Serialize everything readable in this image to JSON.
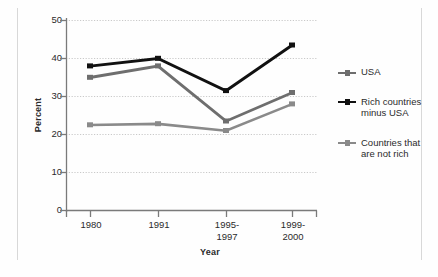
{
  "chart_data": {
    "type": "line",
    "title": "",
    "xlabel": "Year",
    "ylabel": "Percent",
    "categories": [
      "1980",
      "1991",
      "1995-\n1997",
      "1999-\n2000"
    ],
    "category_lines": [
      [
        "1980"
      ],
      [
        "1991"
      ],
      [
        "1995-",
        "1997"
      ],
      [
        "1999-",
        "2000"
      ]
    ],
    "ylim": [
      0,
      50
    ],
    "yticks": [
      0,
      10,
      20,
      30,
      40,
      50
    ],
    "grid": true,
    "legend_position": "right",
    "series": [
      {
        "name": "USA",
        "color": "#6e6e6e",
        "values": [
          35,
          38,
          23.5,
          31
        ]
      },
      {
        "name": "Rich countries minus USA",
        "color": "#111111",
        "values": [
          38,
          40,
          31.5,
          43.5
        ]
      },
      {
        "name": "Countries that are not rich",
        "color": "#8a8a8a",
        "values": [
          22.5,
          22.8,
          21,
          28
        ]
      }
    ]
  },
  "legend": {
    "items": [
      {
        "label": "USA"
      },
      {
        "label_line1": "Rich countries",
        "label_line2": "minus USA"
      },
      {
        "label_line1": "Countries that",
        "label_line2": "are not rich"
      }
    ]
  },
  "axes": {
    "ytick_labels": [
      "50",
      "40",
      "30",
      "20",
      "10",
      "0"
    ],
    "xtick_labels_l1": [
      "1980",
      "1991",
      "1995-",
      "1999-"
    ],
    "xtick_labels_l2": [
      "",
      "",
      "1997",
      "2000"
    ],
    "ylabel": "Percent",
    "xlabel": "Year"
  },
  "colors": {
    "series_usa": "#6e6e6e",
    "series_rich": "#111111",
    "series_notrich": "#8a8a8a",
    "grid": "#cfcfcf",
    "axis": "#6d6d6d",
    "text": "#2b2b2b",
    "background": "#fefefe"
  }
}
